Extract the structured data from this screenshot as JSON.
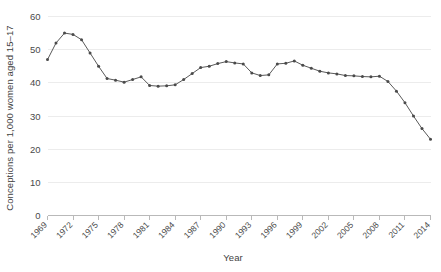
{
  "chart_data": {
    "type": "line",
    "title": "",
    "xlabel": "Year",
    "ylabel": "Conceptions per 1,000 women aged 15–17",
    "ylim": [
      0,
      60
    ],
    "yticks": [
      0,
      10,
      20,
      30,
      40,
      50,
      60
    ],
    "ytick_labels": [
      "0",
      "10",
      "20",
      "30",
      "40",
      "50",
      "60"
    ],
    "xlim": [
      1969,
      2014
    ],
    "xticks": [
      1969,
      1972,
      1975,
      1978,
      1981,
      1984,
      1987,
      1990,
      1993,
      1996,
      1999,
      2002,
      2005,
      2008,
      2011,
      2014
    ],
    "xtick_labels": [
      "1969",
      "1972",
      "1975",
      "1978",
      "1981",
      "1984",
      "1987",
      "1990",
      "1993",
      "1996",
      "1999",
      "2002",
      "2005",
      "2008",
      "2011",
      "2014"
    ],
    "grid": "horizontal",
    "legend": "none",
    "marker": "circle",
    "line_color": "#5a5a5a",
    "marker_color": "#4a4a4a",
    "grid_color": "#ececec",
    "axis_color": "#b9b9b9",
    "background": "#ffffff",
    "x": [
      1969,
      1970,
      1971,
      1972,
      1973,
      1974,
      1975,
      1976,
      1977,
      1978,
      1979,
      1980,
      1981,
      1982,
      1983,
      1984,
      1985,
      1986,
      1987,
      1988,
      1989,
      1990,
      1991,
      1992,
      1993,
      1994,
      1995,
      1996,
      1997,
      1998,
      1999,
      2000,
      2001,
      2002,
      2003,
      2004,
      2005,
      2006,
      2007,
      2008,
      2009,
      2010,
      2011,
      2012,
      2013,
      2014
    ],
    "values": [
      47.0,
      52.0,
      55.0,
      54.6,
      53.0,
      49.0,
      45.0,
      41.3,
      40.8,
      40.2,
      41.0,
      41.8,
      39.2,
      39.0,
      39.1,
      39.4,
      41.0,
      42.8,
      44.6,
      45.0,
      45.8,
      46.4,
      46.0,
      45.7,
      43.0,
      42.2,
      42.4,
      45.7,
      45.9,
      46.6,
      45.3,
      44.4,
      43.5,
      43.0,
      42.7,
      42.2,
      42.1,
      41.9,
      41.8,
      42.0,
      40.4,
      37.5,
      34.0,
      30.0,
      26.2,
      23.0
    ]
  }
}
